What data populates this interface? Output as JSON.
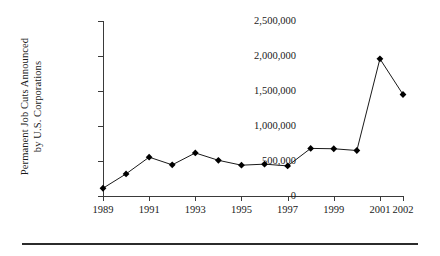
{
  "chart_data": {
    "type": "line",
    "title": "",
    "xlabel": "",
    "ylabel": "Permanent Job Cuts Announced by U.S. Corporations",
    "ylabel_line1": "Permanent Job Cuts Announced",
    "ylabel_line2": "by U.S. Corporations",
    "x": [
      1989,
      1990,
      1991,
      1992,
      1993,
      1994,
      1995,
      1996,
      1997,
      1998,
      1999,
      2000,
      2001,
      2002
    ],
    "values": [
      111000,
      316000,
      555000,
      445000,
      615000,
      510000,
      440000,
      455000,
      430000,
      680000,
      675000,
      650000,
      1960000,
      1450000
    ],
    "series": [
      {
        "name": "Permanent Job Cuts Announced by U.S. Corporations",
        "values": [
          111000,
          316000,
          555000,
          445000,
          615000,
          510000,
          440000,
          455000,
          430000,
          680000,
          675000,
          650000,
          1960000,
          1450000
        ]
      }
    ],
    "xlim": [
      1989,
      2002
    ],
    "ylim": [
      0,
      2500000
    ],
    "ytick_values": [
      0,
      500000,
      1000000,
      1500000,
      2000000,
      2500000
    ],
    "ytick_labels": [
      "0",
      "500,000",
      "1,000,000",
      "1,500,000",
      "2,000,000",
      "2,500,000"
    ],
    "xtick_values": [
      1989,
      1991,
      1993,
      1995,
      1997,
      1999,
      2001,
      2002
    ],
    "xtick_labels": [
      "1989",
      "1991",
      "1993",
      "1995",
      "1997",
      "1999",
      "2001",
      "2002"
    ],
    "grid": false,
    "legend": "none",
    "marker": "diamond",
    "line_color": "#1a1a1a",
    "marker_color": "#000000",
    "axis_color": "#3a3a3a",
    "background": "#ffffff"
  }
}
